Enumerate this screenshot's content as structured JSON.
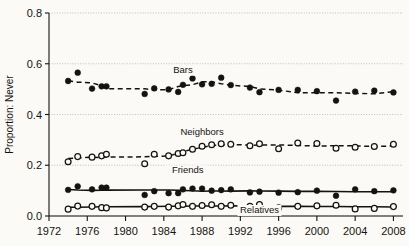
{
  "chart_data": {
    "type": "line",
    "title": "",
    "xlabel": "",
    "ylabel": "Proportion: Never",
    "xlim": [
      1972,
      2009
    ],
    "ylim": [
      0.0,
      0.8
    ],
    "grid": true,
    "legend_position": "inline-annotations",
    "xticks": [
      1972,
      1976,
      1980,
      1984,
      1988,
      1992,
      1996,
      2000,
      2004,
      2008
    ],
    "yticks": [
      "0.0",
      "0.2",
      "0.4",
      "0.6",
      "0.8"
    ],
    "ytick_values": [
      0.0,
      0.2,
      0.4,
      0.6,
      0.8
    ],
    "series": [
      {
        "name": "Bars",
        "marker": "filled-circle",
        "linestyle": "dashed",
        "label_x": 1986.0,
        "label_y": 0.565,
        "x": [
          1974,
          1975,
          1976.5,
          1977.5,
          1978,
          1982,
          1983,
          1984.5,
          1985.5,
          1986,
          1987,
          1988,
          1989,
          1990,
          1991,
          1993,
          1994,
          1996,
          1998,
          2000,
          2002,
          2004,
          2006,
          2008
        ],
        "y": [
          0.532,
          0.565,
          0.502,
          0.511,
          0.511,
          0.481,
          0.503,
          0.499,
          0.489,
          0.517,
          0.542,
          0.519,
          0.521,
          0.545,
          0.516,
          0.506,
          0.488,
          0.497,
          0.497,
          0.492,
          0.455,
          0.49,
          0.494,
          0.487
        ]
      },
      {
        "name": "Neighbors",
        "marker": "open-circle",
        "linestyle": "dashed",
        "label_x": 1988.0,
        "label_y": 0.318,
        "x": [
          1974,
          1975,
          1976.5,
          1977.5,
          1978,
          1982,
          1983,
          1984.5,
          1985.5,
          1986,
          1987,
          1988,
          1989,
          1990,
          1991,
          1993,
          1994,
          1996,
          1998,
          2000,
          2002,
          2004,
          2006,
          2008
        ],
        "y": [
          0.214,
          0.234,
          0.232,
          0.237,
          0.243,
          0.206,
          0.243,
          0.237,
          0.246,
          0.249,
          0.263,
          0.275,
          0.281,
          0.285,
          0.283,
          0.277,
          0.285,
          0.265,
          0.288,
          0.286,
          0.267,
          0.271,
          0.274,
          0.283
        ]
      },
      {
        "name": "Friends",
        "marker": "filled-circle",
        "linestyle": "solid",
        "label_x": 1986.5,
        "label_y": 0.168,
        "x": [
          1974,
          1975,
          1976.5,
          1977.5,
          1978,
          1982,
          1983,
          1984.5,
          1985.5,
          1986,
          1987,
          1988,
          1989,
          1990,
          1991,
          1993,
          1994,
          1996,
          1998,
          2000,
          2002,
          2004,
          2006,
          2008
        ],
        "y": [
          0.103,
          0.117,
          0.105,
          0.112,
          0.112,
          0.083,
          0.098,
          0.09,
          0.09,
          0.105,
          0.108,
          0.108,
          0.1,
          0.102,
          0.105,
          0.093,
          0.096,
          0.092,
          0.094,
          0.1,
          0.08,
          0.105,
          0.098,
          0.101
        ]
      },
      {
        "name": "Relatives",
        "marker": "open-circle",
        "linestyle": "solid",
        "label_x": 1994.0,
        "label_y": 0.012,
        "x": [
          1974,
          1975,
          1976.5,
          1977.5,
          1978,
          1982,
          1983,
          1984.5,
          1985.5,
          1986,
          1987,
          1988,
          1989,
          1990,
          1991,
          1993,
          1994,
          1996,
          1998,
          2000,
          2002,
          2004,
          2006,
          2008
        ],
        "y": [
          0.027,
          0.039,
          0.038,
          0.033,
          0.032,
          0.035,
          0.038,
          0.035,
          0.04,
          0.045,
          0.038,
          0.041,
          0.044,
          0.038,
          0.042,
          0.038,
          0.045,
          0.032,
          0.038,
          0.04,
          0.042,
          0.028,
          0.03,
          0.037
        ]
      }
    ]
  },
  "colors": {
    "background": "#fbfaf7",
    "ink": "#16130f",
    "grid": "#b9b5ad",
    "axis": "#16130f"
  }
}
